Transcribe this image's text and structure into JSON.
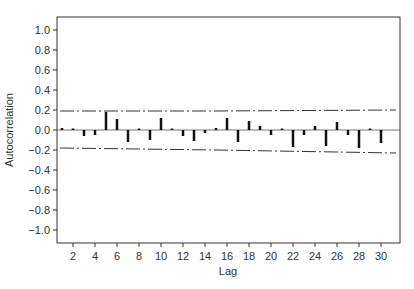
{
  "chart_data": {
    "type": "bar",
    "title": "",
    "xlabel": "Lag",
    "ylabel": "Autocorrelation",
    "xlim": [
      0,
      31
    ],
    "ylim": [
      -1.13,
      1.13
    ],
    "grid": false,
    "legend": null,
    "x_ticks": [
      2,
      4,
      6,
      8,
      10,
      12,
      14,
      16,
      18,
      20,
      22,
      24,
      26,
      28,
      30
    ],
    "y_ticks": [
      1.0,
      0.8,
      0.6,
      0.4,
      0.2,
      0.0,
      -0.2,
      -0.4,
      -0.6,
      -0.8,
      -1.0
    ],
    "y_tick_labels": [
      "1.0",
      "0.8",
      "0.6",
      "0.4",
      "0.2",
      "0.0",
      "−0.2",
      "−0.4",
      "−0.6",
      "−0.8",
      "−1.0"
    ],
    "categories": [
      1,
      2,
      3,
      4,
      5,
      6,
      7,
      8,
      9,
      10,
      11,
      12,
      13,
      14,
      15,
      16,
      17,
      18,
      19,
      20,
      21,
      22,
      23,
      24,
      25,
      26,
      27,
      28,
      29,
      30
    ],
    "series": [
      {
        "name": "ACF",
        "values": [
          0.02,
          0.0,
          -0.06,
          -0.05,
          0.18,
          0.11,
          -0.12,
          0.01,
          -0.1,
          0.12,
          0.01,
          -0.06,
          -0.11,
          -0.03,
          0.02,
          0.12,
          -0.12,
          0.09,
          0.04,
          -0.05,
          0.0,
          -0.17,
          -0.05,
          0.04,
          -0.16,
          0.08,
          -0.05,
          -0.18,
          0.01,
          -0.13
        ]
      }
    ],
    "confidence_bands": {
      "upper": [
        [
          1,
          0.19
        ],
        [
          15,
          0.19
        ],
        [
          30,
          0.2
        ]
      ],
      "lower": [
        [
          1,
          -0.18
        ],
        [
          15,
          -0.2
        ],
        [
          30,
          -0.23
        ]
      ],
      "style": "dash-dot"
    }
  },
  "colors": {
    "bar": "#111111",
    "frame": "#333333",
    "zero_line": "#777777",
    "band": "#333333",
    "text": "#333333"
  }
}
